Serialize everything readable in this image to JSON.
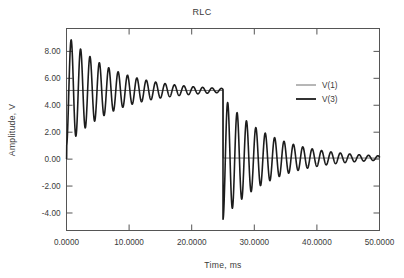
{
  "chart_data": {
    "type": "line",
    "title": "RLC",
    "xlabel": "Time, ms",
    "ylabel": "Amplitude, V",
    "xlim": [
      0,
      50
    ],
    "ylim": [
      -5.3,
      9.7
    ],
    "grid": false,
    "legend_position": "upper-right",
    "x_ticks": [
      0,
      10,
      20,
      30,
      40,
      50
    ],
    "x_tick_labels": [
      "0.0000",
      "10.0000",
      "20.0000",
      "30.0000",
      "40.0000",
      "50.0000"
    ],
    "y_ticks": [
      -4,
      -2,
      0,
      2,
      4,
      6,
      8
    ],
    "y_tick_labels": [
      "-4.00",
      "-2.00",
      "0.00",
      "2.00",
      "4.00",
      "6.00",
      "8.00"
    ],
    "series": [
      {
        "name": "V(1)",
        "role": "source-step",
        "color": "#4a4a4a",
        "line_width": 0.8,
        "description": "Ideal pulse source: 0 V until 0 ms, 5.1 V from 0 ms to 25 ms, 0.1 V after 25 ms",
        "points": [
          [
            0.0,
            0.05
          ],
          [
            0.05,
            5.1
          ],
          [
            25.0,
            5.1
          ],
          [
            25.05,
            0.08
          ],
          [
            50.0,
            0.08
          ]
        ]
      },
      {
        "name": "V(3)",
        "role": "damped-response",
        "color": "#1c1c1c",
        "line_width": 1.6,
        "description": "Underdamped RLC step response: rings about 5.1 V for 0-25 ms, then about 0.1 V for 25-50 ms",
        "model": {
          "baseline_1": 5.1,
          "baseline_2": 0.08,
          "step_time_ms": 25.0,
          "period_ms": 1.5,
          "decay_tau_ms": 7.5,
          "overshoot_1": 4.15,
          "overshoot_2": -4.55,
          "start_value": 0.05
        },
        "peaks": [
          {
            "t": 0.75,
            "v": 9.2
          },
          {
            "t": 1.5,
            "v": 1.7
          },
          {
            "t": 2.25,
            "v": 8.0
          },
          {
            "t": 3.0,
            "v": 2.7
          },
          {
            "t": 3.75,
            "v": 7.35
          },
          {
            "t": 4.5,
            "v": 3.3
          },
          {
            "t": 5.25,
            "v": 6.9
          },
          {
            "t": 6.0,
            "v": 3.8
          },
          {
            "t": 6.75,
            "v": 6.5
          },
          {
            "t": 7.5,
            "v": 4.1
          },
          {
            "t": 8.25,
            "v": 6.2
          },
          {
            "t": 9.0,
            "v": 4.3
          },
          {
            "t": 10.0,
            "v": 6.0
          },
          {
            "t": 12.0,
            "v": 5.7
          },
          {
            "t": 15.0,
            "v": 5.4
          },
          {
            "t": 20.0,
            "v": 5.2
          },
          {
            "t": 25.6,
            "v": -4.4
          },
          {
            "t": 26.4,
            "v": 3.4
          },
          {
            "t": 27.2,
            "v": -3.1
          },
          {
            "t": 28.0,
            "v": 2.2
          },
          {
            "t": 29.0,
            "v": -2.1
          },
          {
            "t": 30.0,
            "v": 1.6
          },
          {
            "t": 32.0,
            "v": 1.0
          },
          {
            "t": 35.0,
            "v": 0.5
          },
          {
            "t": 40.0,
            "v": 0.2
          },
          {
            "t": 50.0,
            "v": 0.08
          }
        ]
      }
    ]
  },
  "legend": {
    "entries": [
      {
        "label": "V(1)",
        "style": "thin"
      },
      {
        "label": "V(3)",
        "style": "thick"
      }
    ]
  }
}
